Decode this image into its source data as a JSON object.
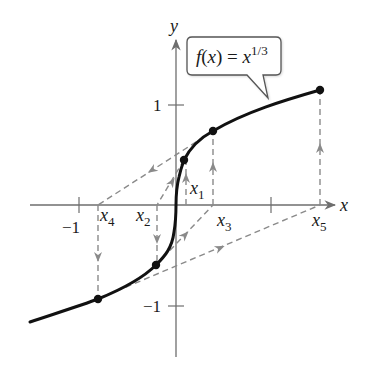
{
  "figure": {
    "function_label": {
      "base": "f(x) = x",
      "exponent": "1/3"
    },
    "axes": {
      "x_label": "x",
      "y_label": "y",
      "x_ticks": [
        {
          "value": -1,
          "label": "−1"
        },
        {
          "value": 1,
          "label": ""
        }
      ],
      "y_ticks": [
        {
          "value": 1,
          "label": "1"
        },
        {
          "value": -1,
          "label": "−1"
        }
      ]
    },
    "iterates": [
      {
        "name": "x1",
        "label_base": "x",
        "label_sub": "1",
        "x": 0.1,
        "fx": 0.464
      },
      {
        "name": "x2",
        "label_base": "x",
        "label_sub": "2",
        "x": -0.2,
        "fx": -0.585
      },
      {
        "name": "x3",
        "label_base": "x",
        "label_sub": "3",
        "x": 0.4,
        "fx": 0.737
      },
      {
        "name": "x4",
        "label_base": "x",
        "label_sub": "4",
        "x": -0.8,
        "fx": -0.928
      },
      {
        "name": "x5",
        "label_base": "x",
        "label_sub": "5",
        "x": 1.6,
        "fx": 1.17
      }
    ],
    "colors": {
      "curve": "#111111",
      "axis": "#6e6e6e",
      "dashed": "#8a8a8a",
      "point": "#111111",
      "callout_border": "#555555"
    }
  }
}
